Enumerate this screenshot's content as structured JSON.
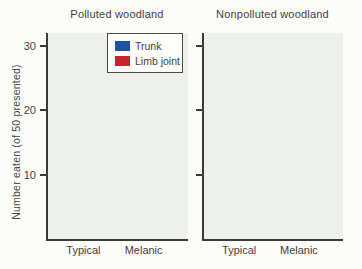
{
  "figure": {
    "y_axis_label": "Number eaten (of 50 presented)"
  },
  "legend": {
    "items": [
      {
        "label": "Trunk",
        "color": "#1d53a4"
      },
      {
        "label": "Limb joint",
        "color": "#c9232b"
      }
    ]
  },
  "chart_data": [
    {
      "type": "bar",
      "title": "Polluted woodland",
      "categories": [
        "Typical",
        "Melanic"
      ],
      "series": [
        {
          "name": "Trunk",
          "color": "#1d53a4",
          "values": [
            30,
            20
          ]
        },
        {
          "name": "Limb joint",
          "color": "#c9232b",
          "values": [
            25.5,
            14
          ]
        }
      ],
      "ylabel": "Number eaten (of 50 presented)",
      "yticks": [
        10,
        20,
        30
      ],
      "ytick_labels": [
        "10",
        "20",
        "30"
      ],
      "ylim": [
        0,
        32
      ],
      "grid": false,
      "legend_position": "upper-right-inside"
    },
    {
      "type": "bar",
      "title": "Nonpolluted woodland",
      "categories": [
        "Typical",
        "Melanic"
      ],
      "series": [
        {
          "name": "Trunk",
          "color": "#1d53a4",
          "values": [
            16,
            31
          ]
        },
        {
          "name": "Limb joint",
          "color": "#c9232b",
          "values": [
            15,
            20
          ]
        }
      ],
      "yticks": [
        10,
        20,
        30
      ],
      "ytick_labels": [],
      "ylim": [
        0,
        32
      ],
      "grid": false
    }
  ]
}
